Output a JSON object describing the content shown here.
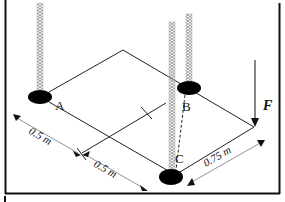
{
  "diagram": {
    "points": {
      "A": "A",
      "B": "B",
      "C": "C"
    },
    "force_label": "F",
    "dimensions": {
      "left_segment_1": "0.5 m",
      "left_segment_2": "0.5 m",
      "right_edge": "0.75 m"
    },
    "colors": {
      "line": "#222222",
      "rope": "#9a9a9a",
      "support": "#000000",
      "background": "#ffffff"
    }
  }
}
